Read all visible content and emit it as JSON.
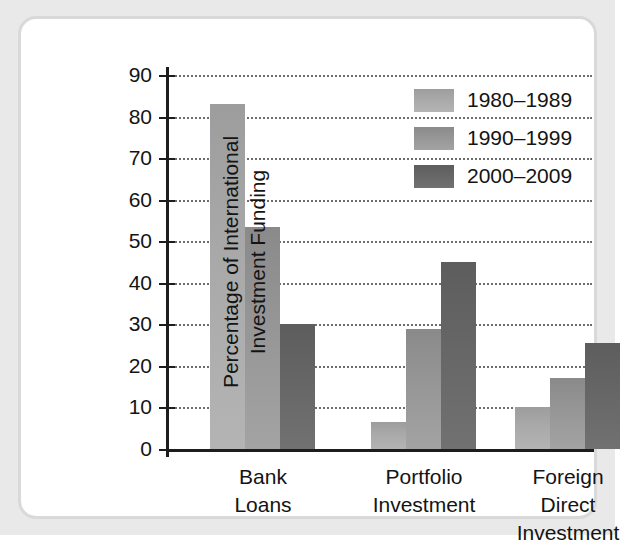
{
  "chart_data": {
    "type": "bar",
    "title": "",
    "xlabel": "",
    "ylabel": "Percentage of International Investment Funding",
    "ylabel_lines": [
      "Percentage of International",
      "Investment Funding"
    ],
    "categories": [
      "Bank Loans",
      "Portfolio Investment",
      "Foreign Direct Investment"
    ],
    "category_lines": [
      [
        "Bank",
        "Loans"
      ],
      [
        "Portfolio",
        "Investment"
      ],
      [
        "Foreign",
        "Direct",
        "Investment"
      ]
    ],
    "series": [
      {
        "name": "1980–1989",
        "color": "#a9a9a9",
        "values": [
          83,
          6.5,
          10
        ]
      },
      {
        "name": "1990–1999",
        "color": "#969696",
        "values": [
          53.5,
          29,
          17
        ]
      },
      {
        "name": "2000–2009",
        "color": "#666666",
        "values": [
          30,
          45,
          25.5
        ]
      }
    ],
    "ylim": [
      0,
      90
    ],
    "yticks": [
      0,
      10,
      20,
      30,
      40,
      50,
      60,
      70,
      80,
      90
    ],
    "ytick_labels": [
      "0",
      "10",
      "20",
      "30",
      "40",
      "50",
      "60",
      "70",
      "80",
      "90"
    ],
    "grid": "horizontal-dotted",
    "legend_position": "top-right"
  },
  "figure": {
    "background_color": "#e9e9e9",
    "panel_color": "#ffffff",
    "panel_border_color": "#d9d9d9",
    "axis_color": "#1d1d1d",
    "text_color": "#141414"
  }
}
